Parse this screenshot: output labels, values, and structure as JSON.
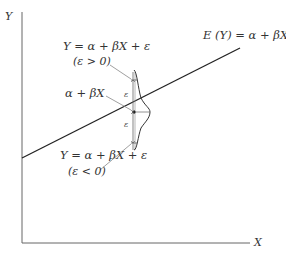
{
  "figure": {
    "y_axis_label": "Y",
    "x_axis_label": "X",
    "regression_line_label": "E (Y) = α + βX",
    "upper_point_label": "Y = α + βX + ε",
    "upper_point_condition": "(ε > 0)",
    "mean_label": "α + βX",
    "lower_point_label": "Y = α + βX + ε",
    "lower_point_condition": "(ε < 0)",
    "epsilon_upper": "ε",
    "epsilon_lower": "ε"
  },
  "colors": {
    "background": "#ffffff",
    "line": "#222222",
    "axis": "#555555",
    "text": "#333333"
  }
}
